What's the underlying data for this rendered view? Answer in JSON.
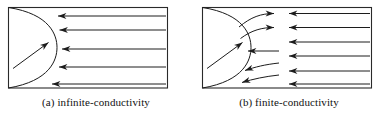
{
  "figure": {
    "background_color": "#ffffff",
    "line_color": "#1a1a1a",
    "panel_count": 2
  },
  "panels": [
    {
      "id": "panel-a",
      "label": "(a)",
      "caption": "(a) infinite-conductivity",
      "name": "infinite-conductivity",
      "box": {
        "x": 8,
        "y": 7,
        "width": 160,
        "height": 81
      },
      "fracture_face": {
        "type": "convex-arc",
        "start_x": 8,
        "start_y": 7,
        "end_x": 8,
        "end_y": 88,
        "bulge_x": 57
      },
      "face_arrow": {
        "from_x": 13,
        "from_y": 68,
        "to_x": 50,
        "to_y": 41,
        "direction": "up-right",
        "description": "diagonal arrow into fracture face"
      },
      "flow_arrows": [
        {
          "y": 16,
          "x_start": 166,
          "x_end": 50,
          "direction": "left",
          "shape": "straight"
        },
        {
          "y": 30,
          "x_start": 166,
          "x_end": 52,
          "direction": "left",
          "shape": "straight"
        },
        {
          "y": 49,
          "x_start": 166,
          "x_end": 55,
          "direction": "left",
          "shape": "straight"
        },
        {
          "y": 67,
          "x_start": 166,
          "x_end": 52,
          "direction": "left",
          "shape": "straight"
        },
        {
          "y": 84,
          "x_start": 166,
          "x_end": 45,
          "direction": "left",
          "shape": "straight"
        }
      ],
      "arrow_count": 5
    },
    {
      "id": "panel-b",
      "label": "(b)",
      "caption": "(b) finite-conductivity",
      "name": "finite-conductivity",
      "box": {
        "x": 9,
        "y": 7,
        "width": 170,
        "height": 81
      },
      "fracture_face": {
        "type": "convex-arc",
        "start_x": 9,
        "start_y": 7,
        "end_x": 9,
        "end_y": 88,
        "bulge_x": 58
      },
      "face_arrow": {
        "from_x": 14,
        "from_y": 68,
        "to_x": 51,
        "to_y": 41,
        "direction": "up-right",
        "description": "diagonal arrow into fracture face"
      },
      "near_face_arrows": [
        {
          "index": 1,
          "shape": "curve-up-right",
          "direction": "right",
          "y_start": 26,
          "y_end": 13,
          "x_start": 46,
          "x_end": 82
        },
        {
          "index": 2,
          "shape": "curve-up-right",
          "direction": "right",
          "y_start": 38,
          "y_end": 27,
          "x_start": 47,
          "x_end": 82
        },
        {
          "index": 3,
          "shape": "straight-short",
          "direction": "left",
          "y_start": 51,
          "y_end": 51,
          "x_start": 85,
          "x_end": 53
        },
        {
          "index": 4,
          "shape": "curve-down-left",
          "direction": "left",
          "y_start": 63,
          "y_end": 70,
          "x_start": 85,
          "x_end": 50
        },
        {
          "index": 5,
          "shape": "curve-down-left",
          "direction": "left",
          "y_start": 75,
          "y_end": 82,
          "x_start": 85,
          "x_end": 47
        }
      ],
      "flow_arrows": [
        {
          "y": 13,
          "x_start": 177,
          "x_end": 95,
          "direction": "left",
          "shape": "straight"
        },
        {
          "y": 27,
          "x_start": 177,
          "x_end": 95,
          "direction": "left",
          "shape": "straight"
        },
        {
          "y": 42,
          "x_start": 177,
          "x_end": 95,
          "direction": "left",
          "shape": "straight"
        },
        {
          "y": 56,
          "x_start": 177,
          "x_end": 95,
          "direction": "left",
          "shape": "straight"
        },
        {
          "y": 71,
          "x_start": 177,
          "x_end": 95,
          "direction": "left",
          "shape": "straight"
        },
        {
          "y": 84,
          "x_start": 177,
          "x_end": 95,
          "direction": "left",
          "shape": "straight"
        }
      ],
      "arrow_count": 6
    }
  ]
}
